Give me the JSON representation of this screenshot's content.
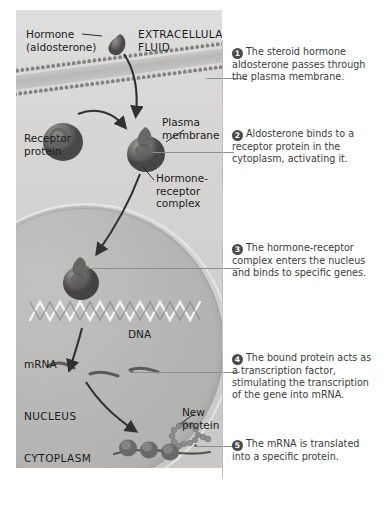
{
  "figure": {
    "panel_color": "#d3d3d1",
    "text_color": "#1b1b1b",
    "step_text_color": "#3b3b3b",
    "marker_color": "#4a4a4a"
  },
  "diagram": {
    "labels": {
      "hormone": "Hormone\n(aldosterone)",
      "extracellular_fluid": "EXTRACELLULAR\nFLUID",
      "plasma_membrane": "Plasma\nmembrane",
      "receptor_protein": "Receptor\nprotein",
      "hormone_receptor_complex": "Hormone-\nreceptor\ncomplex",
      "dna": "DNA",
      "mrna": "mRNA",
      "nucleus": "NUCLEUS",
      "cytoplasm": "CYTOPLASM",
      "new_protein": "New\nprotein"
    }
  },
  "steps": [
    {
      "num": "1",
      "text": "The steroid hormone aldosterone passes through the plasma membrane."
    },
    {
      "num": "2",
      "text": "Aldosterone binds to a receptor protein in the cytoplasm, activating it."
    },
    {
      "num": "3",
      "text": "The hormone-receptor complex enters the nucleus and binds to specific genes."
    },
    {
      "num": "4",
      "text": "The bound protein acts as a transcription factor, stimulating the transcription of the gene into mRNA."
    },
    {
      "num": "5",
      "text": "The mRNA is translated into a specific protein."
    }
  ]
}
